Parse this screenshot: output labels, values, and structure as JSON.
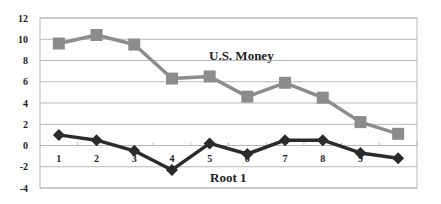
{
  "chart_data": {
    "type": "line",
    "title": "",
    "xlabel": "",
    "ylabel": "",
    "categories": [
      "1",
      "2",
      "3",
      "4",
      "5",
      "6",
      "7",
      "8",
      "9",
      "10"
    ],
    "x_tick_labels": [
      "1",
      "2",
      "3",
      "4",
      "5",
      "6",
      "7",
      "8",
      "9",
      ""
    ],
    "ylim": [
      -4,
      12
    ],
    "y_ticks": [
      12,
      10,
      8,
      6,
      4,
      2,
      0,
      -2,
      -4
    ],
    "grid": true,
    "legend": "none (inline series labels)",
    "series": [
      {
        "name": "U.S. Money",
        "color": "#8c8c8c",
        "marker": "square",
        "values": [
          9.6,
          10.4,
          9.5,
          6.3,
          6.5,
          4.6,
          5.9,
          4.5,
          2.2,
          1.1
        ]
      },
      {
        "name": "Root 1",
        "color": "#2b2b2b",
        "marker": "diamond",
        "values": [
          1.0,
          0.5,
          -0.5,
          -2.3,
          0.2,
          -0.8,
          0.5,
          0.5,
          -0.7,
          -1.2
        ]
      }
    ],
    "annotations": [
      {
        "text": "U.S. Money",
        "x": 5.6,
        "y": 8.4
      },
      {
        "text": "Root 1",
        "x": 5.4,
        "y": -3.0
      }
    ]
  },
  "labels": {
    "us_money": "U.S. Money",
    "root1": "Root 1"
  }
}
